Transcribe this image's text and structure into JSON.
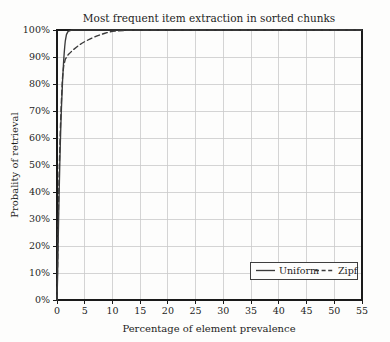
{
  "chart_data": {
    "type": "line",
    "title": "Most frequent item extraction in sorted chunks",
    "xlabel": "Percentage of element prevalence",
    "ylabel": "Probality of retrieval",
    "xlim": [
      0,
      55
    ],
    "ylim": [
      0,
      100
    ],
    "grid": true,
    "legend_position": "bottom-right",
    "xticks": [
      0,
      5,
      10,
      15,
      20,
      25,
      30,
      35,
      40,
      45,
      50,
      55
    ],
    "xtick_labels": [
      "0",
      "5",
      "10",
      "15",
      "20",
      "25",
      "30",
      "35",
      "40",
      "45",
      "50",
      "55"
    ],
    "yticks": [
      0,
      10,
      20,
      30,
      40,
      50,
      60,
      70,
      80,
      90,
      100
    ],
    "ytick_labels": [
      "0%",
      "10%",
      "20%",
      "30%",
      "40%",
      "50%",
      "60%",
      "70%",
      "80%",
      "90%",
      "100%"
    ],
    "line_color": "#3a3a3a",
    "grid_color": "#c9c9c9",
    "axis_color": "#1a1a1a",
    "background_color": "#fdfdfc",
    "series": [
      {
        "name": "Uniform",
        "style": "solid",
        "x": [
          0,
          0.1,
          0.2,
          0.3,
          0.4,
          0.5,
          0.6,
          0.7,
          0.8,
          0.9,
          1.0,
          1.1,
          1.2,
          1.3,
          1.4,
          1.5,
          1.7,
          2.0,
          2.5,
          3.0,
          4.0,
          5.0,
          7.0,
          10.0,
          15.0,
          20.0,
          25.0,
          30.0,
          35.0,
          40.0,
          45.0,
          50.0,
          55.0
        ],
        "values": [
          0,
          8,
          20,
          31,
          41,
          50,
          58,
          65,
          71,
          76,
          81,
          85,
          88.5,
          91.5,
          94,
          96,
          98.3,
          99.5,
          99.9,
          100,
          100,
          100,
          100,
          100,
          100,
          100,
          100,
          100,
          100,
          100,
          100,
          100,
          100
        ]
      },
      {
        "name": "Zipf",
        "style": "dashed",
        "x": [
          0,
          0.1,
          0.2,
          0.3,
          0.4,
          0.5,
          0.6,
          0.7,
          0.8,
          0.9,
          1.0,
          1.2,
          1.5,
          2.0,
          2.5,
          3.0,
          3.5,
          4.0,
          4.5,
          5.0,
          5.5,
          6.0,
          6.5,
          7.0,
          7.5,
          8.0,
          8.5,
          9.0,
          9.5,
          10.0,
          12.0,
          15.0,
          20.0,
          25.0,
          30.0,
          35.0,
          40.0,
          45.0,
          50.0,
          55.0
        ],
        "values": [
          0,
          12,
          26,
          38,
          48,
          56,
          63,
          69,
          74,
          78.5,
          82.5,
          86.5,
          89.2,
          90.8,
          91.8,
          92.8,
          93.6,
          94.4,
          95.1,
          95.7,
          96.2,
          96.7,
          97.2,
          97.6,
          98.0,
          98.4,
          98.7,
          99.0,
          99.3,
          99.5,
          99.8,
          100,
          100,
          100,
          100,
          100,
          100,
          100,
          100,
          100
        ]
      }
    ]
  },
  "legend": {
    "items": [
      {
        "label": "Uniform",
        "style": "solid"
      },
      {
        "label": "Zipf",
        "style": "dashed"
      }
    ]
  }
}
